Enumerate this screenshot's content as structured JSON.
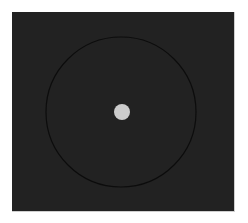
{
  "scene": {
    "background_color": "#ffffff",
    "panel": {
      "color": "#222222",
      "x": 12,
      "y": 12,
      "width": 223,
      "height": 200
    },
    "ring": {
      "cx": 121,
      "cy": 112,
      "r": 75,
      "stroke": "#0c0c0c",
      "stroke_width": 1.2
    },
    "dot": {
      "cx": 122,
      "cy": 112,
      "r": 8,
      "fill": "#cccccc"
    }
  }
}
